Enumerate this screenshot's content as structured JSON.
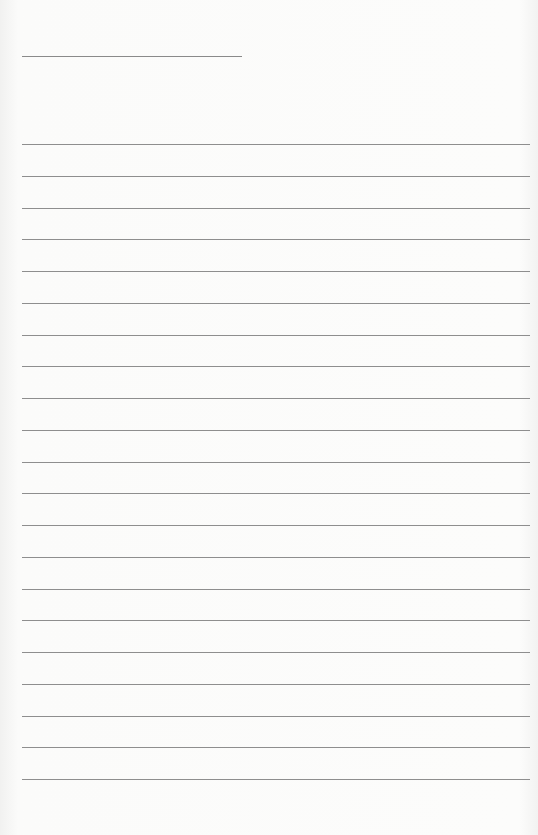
{
  "page": {
    "type": "lined-paper",
    "title_line": {
      "present": true
    },
    "rule_count": 21,
    "rule_color": "#8e8e8e",
    "background_color": "#fbfbfa"
  }
}
